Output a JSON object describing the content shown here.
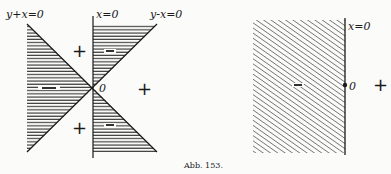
{
  "figure": {
    "caption": "Abb. 153.",
    "left_panel": {
      "lines": {
        "y_plus_x": "y+x=0",
        "x_axis_line": "x=0",
        "y_minus_x": "y-x=0"
      },
      "origin_label": "0",
      "regions": {
        "top_left": "+",
        "top_center": "−",
        "left": "−",
        "right": "+",
        "bottom_left": "+",
        "bottom_center": "−"
      }
    },
    "right_panel": {
      "line_label": "x=0",
      "origin_label": "0",
      "regions": {
        "left": "−",
        "right": "+"
      }
    },
    "colors": {
      "ink": "#1a1a1a",
      "paper": "#fbfbfa"
    }
  }
}
